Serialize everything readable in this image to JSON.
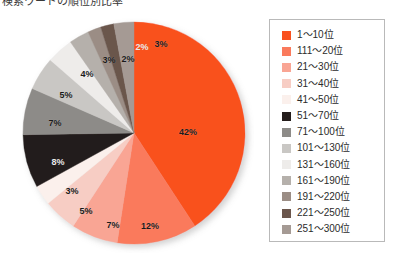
{
  "caption": {
    "text": "検索ワードの順位別比率"
  },
  "chart_data": {
    "type": "pie",
    "title": "",
    "xlabel": "",
    "ylabel": "",
    "legend_position": "right",
    "grid": false,
    "unit": "%",
    "categories": [
      "1～10位",
      "111～20位",
      "21～30位",
      "31～40位",
      "41～50位",
      "51～70位",
      "71～100位",
      "101～130位",
      "131～160位",
      "161～190位",
      "191～220位",
      "221～250位",
      "251～300位"
    ],
    "values": [
      42,
      12,
      7,
      5,
      3,
      8,
      7,
      5,
      4,
      3,
      2,
      2,
      3
    ],
    "labels": [
      "42%",
      "12%",
      "7%",
      "5%",
      "3%",
      "8%",
      "7%",
      "5%",
      "4%",
      "3%",
      "2%",
      "2%",
      "3%"
    ],
    "colors": [
      "#f9511f",
      "#fa7a5c",
      "#f9a594",
      "#f7cdc4",
      "#fbf0ec",
      "#241d1b",
      "#8d8b88",
      "#c9c7c4",
      "#eeecea",
      "#b5b0ab",
      "#9b8d85",
      "#6b564c",
      "#a59a94"
    ],
    "slices": [
      {
        "label": "1～10位",
        "value": 42,
        "display": "42%",
        "color": "#f9511f",
        "label_x": 166,
        "label_y": 115,
        "dark_bg": false
      },
      {
        "label": "111～20位",
        "value": 12,
        "display": "12%",
        "color": "#fa7a5c",
        "label_x": 128,
        "label_y": 209,
        "dark_bg": false
      },
      {
        "label": "21～30位",
        "value": 7,
        "display": "7%",
        "color": "#f9a594",
        "label_x": 91,
        "label_y": 208,
        "dark_bg": false
      },
      {
        "label": "31～40位",
        "value": 5,
        "display": "5%",
        "color": "#f7cdc4",
        "label_x": 64,
        "label_y": 194,
        "dark_bg": false
      },
      {
        "label": "41～50位",
        "value": 3,
        "display": "3%",
        "color": "#fbf0ec",
        "label_x": 50,
        "label_y": 174,
        "dark_bg": false
      },
      {
        "label": "51～70位",
        "value": 8,
        "display": "8%",
        "color": "#241d1b",
        "label_x": 36,
        "label_y": 145,
        "dark_bg": true
      },
      {
        "label": "71～100位",
        "value": 7,
        "display": "7%",
        "color": "#8d8b88",
        "label_x": 33,
        "label_y": 106,
        "dark_bg": false
      },
      {
        "label": "101～130位",
        "value": 5,
        "display": "5%",
        "color": "#c9c7c4",
        "label_x": 44,
        "label_y": 78,
        "dark_bg": false
      },
      {
        "label": "131～160位",
        "value": 4,
        "display": "4%",
        "color": "#eeecea",
        "label_x": 65,
        "label_y": 57,
        "dark_bg": false
      },
      {
        "label": "161～190位",
        "value": 3,
        "display": "3%",
        "color": "#b5b0ab",
        "label_x": 87,
        "label_y": 43,
        "dark_bg": false
      },
      {
        "label": "191～220位",
        "value": 2,
        "display": "2%",
        "color": "#9b8d85",
        "label_x": 106,
        "label_y": 42,
        "dark_bg": false
      },
      {
        "label": "221～250位",
        "value": 2,
        "display": "2%",
        "color": "#6b564c",
        "label_x": 120,
        "label_y": 30,
        "dark_bg": true
      },
      {
        "label": "251～300位",
        "value": 3,
        "display": "3%",
        "color": "#a59a94",
        "label_x": 139,
        "label_y": 27,
        "dark_bg": false
      }
    ]
  },
  "legend": {
    "items": [
      {
        "label": "1～10位",
        "color": "#f9511f"
      },
      {
        "label": "111～20位",
        "color": "#fa7a5c"
      },
      {
        "label": "21～30位",
        "color": "#f9a594"
      },
      {
        "label": "31～40位",
        "color": "#f7cdc4"
      },
      {
        "label": "41～50位",
        "color": "#fbf0ec"
      },
      {
        "label": "51～70位",
        "color": "#241d1b"
      },
      {
        "label": "71～100位",
        "color": "#8d8b88"
      },
      {
        "label": "101～130位",
        "color": "#c9c7c4"
      },
      {
        "label": "131～160位",
        "color": "#eeecea"
      },
      {
        "label": "161～190位",
        "color": "#b5b0ab"
      },
      {
        "label": "191～220位",
        "color": "#9b8d85"
      },
      {
        "label": "221～250位",
        "color": "#6b564c"
      },
      {
        "label": "251～300位",
        "color": "#a59a94"
      }
    ]
  }
}
